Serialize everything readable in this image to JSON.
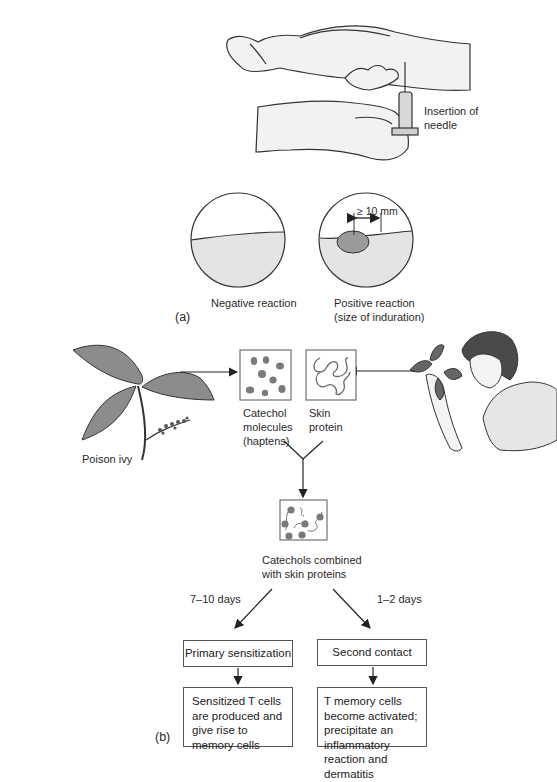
{
  "panel_a": {
    "label": "(a)",
    "needle_label_line1": "Insertion of",
    "needle_label_line2": "needle",
    "negative": {
      "label": "Negative reaction"
    },
    "positive": {
      "label_line1": "Positive reaction",
      "label_line2": "(size of induration)",
      "measure": "≥ 10 mm"
    }
  },
  "panel_b": {
    "label": "(b)",
    "poison_ivy_label": "Poison ivy",
    "catechol": {
      "line1": "Catechol",
      "line2": "molecules",
      "line3": "(haptens)"
    },
    "skin_protein": {
      "line1": "Skin",
      "line2": "protein"
    },
    "combined": {
      "line1": "Catechols combined",
      "line2": "with skin proteins"
    },
    "left_branch": {
      "time": "7–10 days",
      "title": "Primary sensitization",
      "result": "Sensitized T cells are produced and give rise to memory cells"
    },
    "right_branch": {
      "time": "1–2 days",
      "title": "Second contact",
      "result": "T memory cells become activated; precipitate an inflammatory reaction and dermatitis"
    }
  },
  "colors": {
    "line": "#333333",
    "skin_fill": "#e6e6e6",
    "dark_fill": "#7a7a7a",
    "leaf_fill": "#8a8a8a",
    "hair_fill": "#4a4a4a"
  }
}
